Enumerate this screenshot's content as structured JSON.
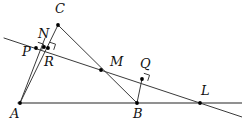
{
  "figure": {
    "type": "geometry-diagram",
    "width": 242,
    "height": 124,
    "background_color": "#ffffff",
    "stroke_color": "#3a3a3a",
    "baseline_color": "#6e6e6e",
    "label_color": "#111111",
    "point_color": "#000000"
  },
  "points": {
    "A": {
      "label": "A",
      "x": 20,
      "y": 103,
      "label_x": 10,
      "label_y": 107,
      "dot": true
    },
    "B": {
      "label": "B",
      "x": 137,
      "y": 103,
      "label_x": 133,
      "label_y": 107,
      "dot": true
    },
    "C": {
      "label": "C",
      "x": 58,
      "y": 25,
      "label_x": 55,
      "label_y": 2,
      "dot": true
    },
    "L": {
      "label": "L",
      "x": 200,
      "y": 103,
      "label_x": 201,
      "label_y": 84,
      "dot": true
    },
    "M": {
      "label": "M",
      "x": 101,
      "y": 70,
      "label_x": 110,
      "label_y": 55,
      "dot": true
    },
    "N": {
      "label": "N",
      "x": 44,
      "y": 47,
      "label_x": 38,
      "label_y": 27,
      "dot": true
    },
    "P": {
      "label": "P",
      "x": 36,
      "y": 48,
      "label_x": 22,
      "label_y": 45,
      "dot": true
    },
    "Q": {
      "label": "Q",
      "x": 142,
      "y": 79,
      "label_x": 140,
      "label_y": 57,
      "dot": true
    },
    "R": {
      "label": "R",
      "x": 48,
      "y": 48,
      "label_x": 44,
      "label_y": 55,
      "dot": true
    }
  },
  "segments": [
    {
      "name": "baseline-A-to-right-edge",
      "x1": 18,
      "y1": 103,
      "x2": 242,
      "y2": 103,
      "kind": "baseline"
    },
    {
      "name": "transversal-P-through-L",
      "x1": 4,
      "y1": 38,
      "x2": 242,
      "y2": 117,
      "kind": "transversal"
    },
    {
      "name": "segment-C-to-A",
      "x1": 58,
      "y1": 25,
      "x2": 20,
      "y2": 103,
      "kind": "line"
    },
    {
      "name": "segment-C-to-B",
      "x1": 58,
      "y1": 25,
      "x2": 137,
      "y2": 103,
      "kind": "line"
    },
    {
      "name": "segment-A-to-N",
      "x1": 20,
      "y1": 103,
      "x2": 45,
      "y2": 38,
      "kind": "line"
    },
    {
      "name": "segment-B-to-Q",
      "x1": 137,
      "y1": 103,
      "x2": 142,
      "y2": 79,
      "kind": "line"
    }
  ],
  "right_angle_marks": [
    {
      "name": "right-angle-at-P",
      "x": 36,
      "y": 48,
      "size": 6,
      "rotate": 18
    },
    {
      "name": "right-angle-at-R",
      "x": 48,
      "y": 48,
      "size": 6,
      "rotate": 18
    },
    {
      "name": "right-angle-at-Q",
      "x": 142,
      "y": 79,
      "size": 6,
      "rotate": 18
    }
  ]
}
